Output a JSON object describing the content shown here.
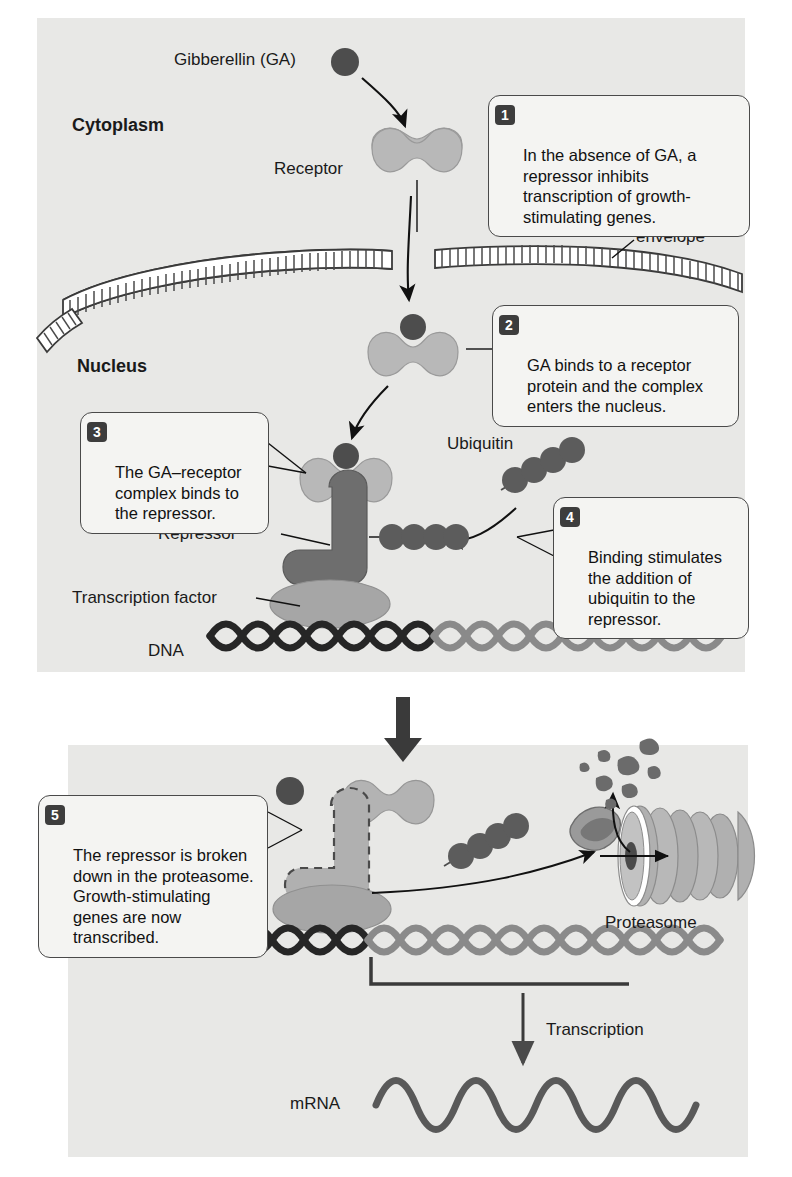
{
  "figure": {
    "panels": [
      "top",
      "bottom"
    ]
  },
  "colors": {
    "panel_bg": "#e8e8e6",
    "ga_dark": "#4d4d4d",
    "receptor_light": "#b8b8b8",
    "repressor_dark": "#6e6e6e",
    "transcription_factor": "#a6a6a6",
    "dna_dark": "#262626",
    "dna_light": "#808080",
    "mrna": "#595959",
    "callout_border": "#4a4a4a",
    "callout_bg": "#f4f4f2",
    "badge_bg": "#3d3d3d"
  },
  "labels": {
    "gibberellin": "Gibberellin (GA)",
    "cytoplasm": "Cytoplasm",
    "receptor": "Receptor",
    "nuclear_envelope_line1": "Nuclear",
    "nuclear_envelope_line2": "envelope",
    "nucleus": "Nucleus",
    "ubiquitin": "Ubiquitin",
    "repressor": "Repressor",
    "transcription_factor": "Transcription factor",
    "dna": "DNA",
    "proteasome": "Proteasome",
    "transcription": "Transcription",
    "mrna": "mRNA"
  },
  "callouts": [
    {
      "number": "1",
      "text": "In the absence of GA, a repressor inhibits transcription of growth-stimulating genes."
    },
    {
      "number": "2",
      "text": "GA binds to a receptor protein and the complex enters the nucleus."
    },
    {
      "number": "3",
      "text": "The GA–receptor complex binds to the repressor."
    },
    {
      "number": "4",
      "text": "Binding stimulates the addition of ubiquitin to the repressor."
    },
    {
      "number": "5",
      "text": "The repressor is broken down in the proteasome. Growth-stimulating genes are now transcribed."
    }
  ]
}
